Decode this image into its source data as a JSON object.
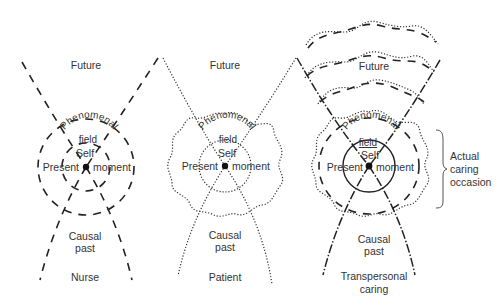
{
  "diagram": {
    "panels": [
      {
        "id": "nurse",
        "future": "Future",
        "field_line1": "Phenomenal",
        "field_line2": "field",
        "self": "Self",
        "present": "Present",
        "moment": "moment",
        "causal_line1": "Causal",
        "causal_line2": "past",
        "caption_line1": "Nurse",
        "line_style": "dashed"
      },
      {
        "id": "patient",
        "future": "Future",
        "field_line1": "Phenomenal",
        "field_line2": "field",
        "self": "Self",
        "present": "Present",
        "moment": "moment",
        "causal_line1": "Causal",
        "causal_line2": "past",
        "caption_line1": "Patient",
        "line_style": "dotted"
      },
      {
        "id": "transpersonal",
        "future": "Future",
        "field_line1": "Phenomenal",
        "field_line2": "field",
        "self": "Self",
        "present": "Present",
        "moment": "moment",
        "causal_line1": "Causal",
        "causal_line2": "past",
        "caption_line1": "Transpersonal",
        "caption_line2": "caring",
        "line_style": "dash-dot combined"
      }
    ],
    "bracket_label": {
      "line1": "Actual",
      "line2": "caring",
      "line3": "occasion"
    }
  }
}
